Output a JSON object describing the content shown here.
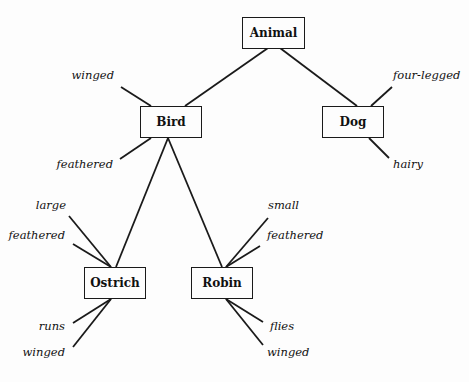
{
  "diagram": {
    "type": "semantic-network",
    "nodes": [
      {
        "id": "animal",
        "label": "Animal"
      },
      {
        "id": "bird",
        "label": "Bird"
      },
      {
        "id": "dog",
        "label": "Dog"
      },
      {
        "id": "ostrich",
        "label": "Ostrich"
      },
      {
        "id": "robin",
        "label": "Robin"
      }
    ],
    "edges": [
      {
        "from": "animal",
        "to": "bird"
      },
      {
        "from": "animal",
        "to": "dog"
      },
      {
        "from": "bird",
        "to": "ostrich"
      },
      {
        "from": "bird",
        "to": "robin"
      }
    ],
    "attributes": {
      "bird": [
        "winged",
        "feathered"
      ],
      "dog": [
        "four-legged",
        "hairy"
      ],
      "ostrich": [
        "large",
        "feathered",
        "runs",
        "winged"
      ],
      "robin": [
        "small",
        "feathered",
        "flies",
        "winged"
      ]
    }
  }
}
